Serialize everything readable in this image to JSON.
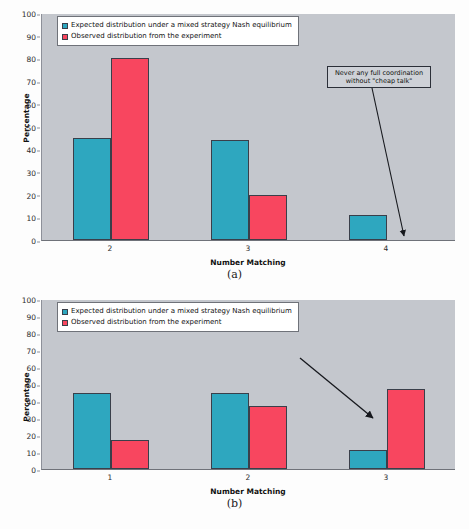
{
  "colors": {
    "expected": "#2ea7bf",
    "observed": "#f8465f",
    "plot_background": "#c4c7cd",
    "page_background": "#fdfdfd",
    "axis": "#6f7279"
  },
  "legend": {
    "expected_label": "Expected distribution under a mixed strategy Nash equilibrium",
    "observed_label": "Observed distribution from the experiment"
  },
  "figures": [
    {
      "caption": "(a)",
      "annotation": "Never any full coordination\nwithout \"cheap talk\"",
      "chart_data": {
        "type": "bar",
        "title": "",
        "xlabel": "Number Matching",
        "ylabel": "Percentage",
        "categories": [
          "2",
          "3",
          "4"
        ],
        "yticks": [
          "0",
          "10",
          "20",
          "30",
          "40",
          "50",
          "60",
          "70",
          "80",
          "90",
          "100"
        ],
        "ylim": [
          0,
          100
        ],
        "grid": false,
        "legend_position": "top-left",
        "series": [
          {
            "name": "Expected distribution under a mixed strategy Nash equilibrium",
            "color": "#2ea7bf",
            "values": [
              45,
              44,
              11
            ]
          },
          {
            "name": "Observed distribution from the experiment",
            "color": "#f8465f",
            "values": [
              80,
              20,
              0
            ]
          }
        ]
      }
    },
    {
      "caption": "(b)",
      "annotation": "Modest coordination with\nrepeated \"cheap talk\"",
      "chart_data": {
        "type": "bar",
        "title": "",
        "xlabel": "Number Matching",
        "ylabel": "Percentage",
        "categories": [
          "1",
          "2",
          "3"
        ],
        "yticks": [
          "0",
          "10",
          "20",
          "30",
          "40",
          "50",
          "60",
          "70",
          "80",
          "90",
          "100"
        ],
        "ylim": [
          0,
          100
        ],
        "grid": false,
        "legend_position": "top-left",
        "series": [
          {
            "name": "Expected distribution under a mixed strategy Nash equilibrium",
            "color": "#2ea7bf",
            "values": [
              45,
              45,
              11
            ]
          },
          {
            "name": "Observed distribution from the experiment",
            "color": "#f8465f",
            "values": [
              17,
              37,
              47
            ]
          }
        ]
      }
    }
  ]
}
